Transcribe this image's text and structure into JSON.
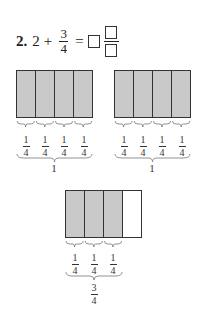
{
  "problem": {
    "number": "2.",
    "whole": "2",
    "plus": "+",
    "fraction": {
      "numerator": "3",
      "denominator": "4"
    },
    "equals": "=",
    "answer": {
      "whole_box": "",
      "numerator_box": "",
      "denominator_box": ""
    }
  },
  "models": [
    {
      "id": "whole-1",
      "parts": 4,
      "shaded": 4,
      "part_labels": [
        {
          "numerator": "1",
          "denominator": "4"
        },
        {
          "numerator": "1",
          "denominator": "4"
        },
        {
          "numerator": "1",
          "denominator": "4"
        },
        {
          "numerator": "1",
          "denominator": "4"
        }
      ],
      "total_label": "1"
    },
    {
      "id": "whole-2",
      "parts": 4,
      "shaded": 4,
      "part_labels": [
        {
          "numerator": "1",
          "denominator": "4"
        },
        {
          "numerator": "1",
          "denominator": "4"
        },
        {
          "numerator": "1",
          "denominator": "4"
        },
        {
          "numerator": "1",
          "denominator": "4"
        }
      ],
      "total_label": "1"
    },
    {
      "id": "three-fourths",
      "parts": 4,
      "shaded": 3,
      "part_labels": [
        {
          "numerator": "1",
          "denominator": "4"
        },
        {
          "numerator": "1",
          "denominator": "4"
        },
        {
          "numerator": "1",
          "denominator": "4"
        }
      ],
      "total_label": {
        "numerator": "3",
        "denominator": "4"
      }
    }
  ],
  "colors": {
    "shaded": "#c9c9c9",
    "border": "#333333"
  }
}
